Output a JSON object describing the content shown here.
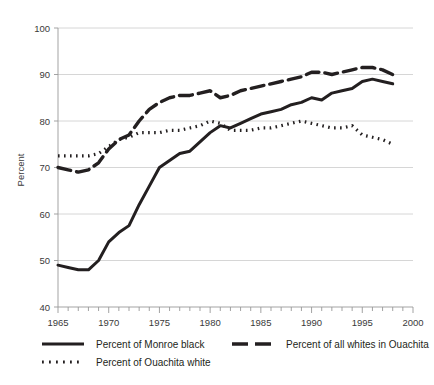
{
  "chart_data": {
    "type": "line",
    "title": "",
    "xlabel": "",
    "ylabel": "Percent",
    "xlim": [
      1965,
      2000
    ],
    "ylim": [
      40,
      100
    ],
    "xticks": [
      1965,
      1970,
      1975,
      1980,
      1985,
      1990,
      1995,
      2000
    ],
    "xtick_labels": [
      "1965",
      "1970",
      "1975",
      "1980",
      "1985",
      "1990",
      "1995",
      "2000"
    ],
    "yticks": [
      40,
      50,
      60,
      70,
      80,
      90,
      100
    ],
    "ytick_labels": [
      "40",
      "50",
      "60",
      "70",
      "80",
      "90",
      "100"
    ],
    "minor_xtick_step": 1,
    "grid": "horizontal",
    "grid_color": "#cccccc",
    "line_color": "#231f20",
    "legend_position": "below-plot",
    "x": [
      1965,
      1966,
      1967,
      1968,
      1969,
      1970,
      1971,
      1972,
      1973,
      1974,
      1975,
      1976,
      1977,
      1978,
      1979,
      1980,
      1981,
      1982,
      1983,
      1984,
      1985,
      1986,
      1987,
      1988,
      1989,
      1990,
      1991,
      1992,
      1993,
      1994,
      1995,
      1996,
      1997,
      1998
    ],
    "series": [
      {
        "name": "Percent of Monroe black",
        "style": "solid",
        "values": [
          49.0,
          48.5,
          48.0,
          48.0,
          50.0,
          54.0,
          56.0,
          57.5,
          62.0,
          66.0,
          70.0,
          71.5,
          73.0,
          73.5,
          75.5,
          77.5,
          79.0,
          78.5,
          79.5,
          80.5,
          81.5,
          82.0,
          82.5,
          83.5,
          84.0,
          85.0,
          84.5,
          86.0,
          86.5,
          87.0,
          88.5,
          89.0,
          88.5,
          88.0
        ]
      },
      {
        "name": "Percent of all whites in Ouachita",
        "style": "dashed",
        "values": [
          70.0,
          69.5,
          69.0,
          69.5,
          71.0,
          74.0,
          76.0,
          77.0,
          80.0,
          82.5,
          84.0,
          85.0,
          85.5,
          85.5,
          86.0,
          86.5,
          85.0,
          85.5,
          86.5,
          87.0,
          87.5,
          88.0,
          88.5,
          89.0,
          89.5,
          90.5,
          90.5,
          90.0,
          90.5,
          91.0,
          91.5,
          91.5,
          91.0,
          90.0
        ]
      },
      {
        "name": "Percent of Ouachita white",
        "style": "dotted",
        "values": [
          72.5,
          72.5,
          72.5,
          72.5,
          73.0,
          74.5,
          76.0,
          76.5,
          77.5,
          77.5,
          77.5,
          78.0,
          78.0,
          78.5,
          79.0,
          80.0,
          79.5,
          78.0,
          78.0,
          78.0,
          78.5,
          78.5,
          79.0,
          79.5,
          80.0,
          79.5,
          79.0,
          78.5,
          78.5,
          79.0,
          77.0,
          76.5,
          76.0,
          75.0
        ]
      }
    ],
    "legend": [
      {
        "label": "Percent of Monroe black",
        "style": "solid"
      },
      {
        "label": "Percent of all whites in Ouachita",
        "style": "dashed"
      },
      {
        "label": "Percent of Ouachita white",
        "style": "dotted"
      }
    ]
  }
}
